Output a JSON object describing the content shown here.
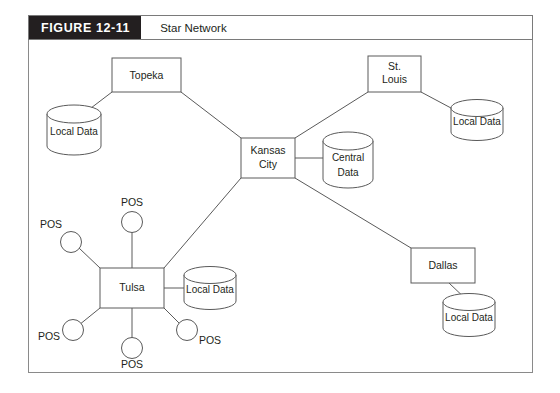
{
  "figure": {
    "number": "FIGURE 12-11",
    "title": "Star Network",
    "number_bg_color": "#231f20",
    "number_text_color": "#ffffff",
    "line_color": "#5a5a5a",
    "frame_color": "#8a8a8a",
    "background_color": "#ffffff"
  },
  "diagram": {
    "type": "star-network-topology",
    "hub": {
      "label_line1": "Kansas",
      "label_line2": "City",
      "label": "Kansas City",
      "database_label_line1": "Central",
      "database_label_line2": "Data",
      "database_label": "Central Data"
    },
    "nodes": [
      {
        "id": "topeka",
        "label": "Topeka",
        "database_label": "Local Data",
        "pos_terminals": 0
      },
      {
        "id": "st-louis",
        "label": "St. Louis",
        "label_line1": "St.",
        "label_line2": "Louis",
        "database_label": "Local Data",
        "pos_terminals": 0
      },
      {
        "id": "dallas",
        "label": "Dallas",
        "database_label": "Local Data",
        "pos_terminals": 0
      },
      {
        "id": "tulsa",
        "label": "Tulsa",
        "database_label": "Local Data",
        "pos_terminals": 5
      }
    ],
    "pos_terminals": [
      {
        "id": "tulsa-pos-top",
        "label": "POS"
      },
      {
        "id": "tulsa-pos-upper-left",
        "label": "POS"
      },
      {
        "id": "tulsa-pos-lower-left",
        "label": "POS"
      },
      {
        "id": "tulsa-pos-bottom",
        "label": "POS"
      },
      {
        "id": "tulsa-pos-lower-right",
        "label": "POS"
      }
    ],
    "links": [
      {
        "from": "kansas-city",
        "to": "topeka"
      },
      {
        "from": "kansas-city",
        "to": "st-louis"
      },
      {
        "from": "kansas-city",
        "to": "dallas"
      },
      {
        "from": "kansas-city",
        "to": "tulsa"
      },
      {
        "from": "kansas-city",
        "to": "central-data"
      },
      {
        "from": "topeka",
        "to": "topeka-local-data"
      },
      {
        "from": "st-louis",
        "to": "st-louis-local-data"
      },
      {
        "from": "dallas",
        "to": "dallas-local-data"
      },
      {
        "from": "tulsa",
        "to": "tulsa-local-data"
      }
    ]
  }
}
